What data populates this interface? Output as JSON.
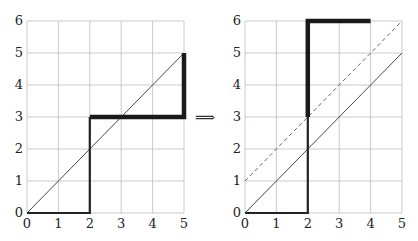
{
  "diagram": {
    "arrow_symbol": "⟹",
    "left_plot": {
      "x_ticks": [
        "0",
        "1",
        "2",
        "3",
        "4",
        "5"
      ],
      "y_ticks": [
        "0",
        "1",
        "2",
        "3",
        "4",
        "5",
        "6"
      ],
      "diagonal": "y = x",
      "path_thin": [
        [
          0,
          0
        ],
        [
          2,
          0
        ],
        [
          2,
          3
        ]
      ],
      "path_thick": [
        [
          2,
          3
        ],
        [
          5,
          3
        ],
        [
          5,
          5
        ]
      ]
    },
    "right_plot": {
      "x_ticks": [
        "0",
        "1",
        "2",
        "3",
        "4",
        "5"
      ],
      "y_ticks": [
        "0",
        "1",
        "2",
        "3",
        "4",
        "5",
        "6"
      ],
      "diagonal": "y = x",
      "dashed_diagonal": "y = x + 1",
      "path_thin": [
        [
          0,
          0
        ],
        [
          2,
          0
        ],
        [
          2,
          3
        ]
      ],
      "path_thick": [
        [
          2,
          3
        ],
        [
          2,
          6
        ],
        [
          4,
          6
        ]
      ]
    }
  }
}
